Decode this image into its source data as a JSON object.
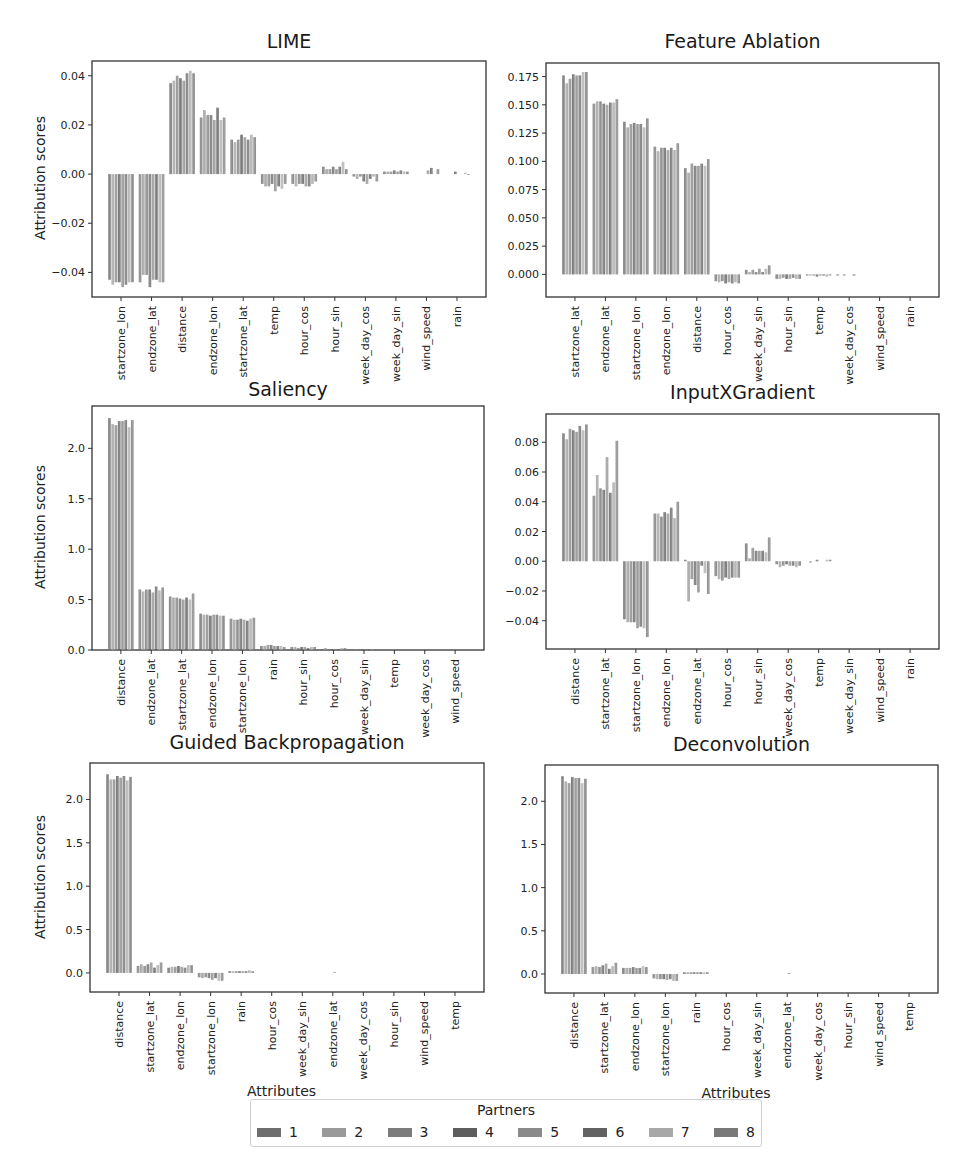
{
  "legend": {
    "title": "Partners",
    "items": [
      {
        "label": "1",
        "color": "#6e6e6e"
      },
      {
        "label": "2",
        "color": "#9a9a9a"
      },
      {
        "label": "3",
        "color": "#7c7c7c"
      },
      {
        "label": "4",
        "color": "#5e5e5e"
      },
      {
        "label": "5",
        "color": "#8a8a8a"
      },
      {
        "label": "6",
        "color": "#626262"
      },
      {
        "label": "7",
        "color": "#a8a8a8"
      },
      {
        "label": "8",
        "color": "#787878"
      }
    ]
  },
  "chart_data": [
    {
      "id": "lime",
      "type": "bar",
      "title": "LIME",
      "ylabel": "Attribution scores",
      "xlabel": "",
      "ylim": [
        -0.05,
        0.046
      ],
      "yticks": [
        -0.04,
        -0.02,
        0.0,
        0.02,
        0.04
      ],
      "ytick_labels": [
        "−0.04",
        "−0.02",
        "0.00",
        "0.02",
        "0.04"
      ],
      "categories": [
        "startzone_lon",
        "endzone_lat",
        "distance",
        "endzone_lon",
        "startzone_lat",
        "temp",
        "hour_cos",
        "hour_sin",
        "week_day_cos",
        "week_day_sin",
        "wind_speed",
        "rain"
      ],
      "series_names": [
        "1",
        "2",
        "3",
        "4",
        "5",
        "6",
        "7",
        "8"
      ],
      "values": [
        [
          -0.043,
          -0.045,
          -0.044,
          -0.044,
          -0.046,
          -0.045,
          -0.044,
          -0.044
        ],
        [
          -0.044,
          -0.041,
          -0.041,
          -0.046,
          -0.043,
          -0.043,
          -0.044,
          -0.044
        ],
        [
          0.037,
          0.038,
          0.04,
          0.039,
          0.038,
          0.041,
          0.042,
          0.041
        ],
        [
          0.023,
          0.026,
          0.024,
          0.024,
          0.022,
          0.027,
          0.022,
          0.023
        ],
        [
          0.014,
          0.013,
          0.014,
          0.016,
          0.015,
          0.014,
          0.016,
          0.015
        ],
        [
          -0.004,
          -0.005,
          -0.005,
          -0.004,
          -0.007,
          -0.005,
          -0.006,
          -0.004
        ],
        [
          -0.004,
          -0.005,
          -0.004,
          -0.004,
          -0.005,
          -0.005,
          -0.004,
          -0.003
        ],
        [
          0.003,
          0.002,
          0.002,
          0.003,
          0.002,
          0.003,
          0.005,
          0.002
        ],
        [
          -0.001,
          -0.002,
          -0.001,
          -0.003,
          -0.004,
          -0.002,
          -0.001,
          -0.003
        ],
        [
          0.001,
          0.001,
          0.001,
          0.0015,
          0.001,
          0.0015,
          0.001,
          0.001
        ],
        [
          0.0,
          0.0,
          0.0,
          0.0,
          0.0015,
          0.0025,
          0.0,
          0.002
        ],
        [
          0.0,
          0.0,
          0.0,
          0.001,
          0.0,
          0.0,
          0.0005,
          -0.0003
        ]
      ]
    },
    {
      "id": "feature_ablation",
      "type": "bar",
      "title": "Feature Ablation",
      "ylabel": "",
      "xlabel": "",
      "ylim": [
        -0.02,
        0.187
      ],
      "yticks": [
        0.0,
        0.025,
        0.05,
        0.075,
        0.1,
        0.125,
        0.15,
        0.175
      ],
      "ytick_labels": [
        "0.000",
        "0.025",
        "0.050",
        "0.075",
        "0.100",
        "0.125",
        "0.150",
        "0.175"
      ],
      "categories": [
        "startzone_lat",
        "endzone_lat",
        "startzone_lon",
        "endzone_lon",
        "distance",
        "hour_cos",
        "week_day_sin",
        "hour_sin",
        "temp",
        "week_day_cos",
        "wind_speed",
        "rain"
      ],
      "series_names": [
        "1",
        "2",
        "3",
        "4",
        "5",
        "6",
        "7",
        "8"
      ],
      "values": [
        [
          0.176,
          0.169,
          0.173,
          0.177,
          0.176,
          0.176,
          0.179,
          0.179
        ],
        [
          0.151,
          0.153,
          0.153,
          0.151,
          0.15,
          0.152,
          0.152,
          0.155
        ],
        [
          0.135,
          0.13,
          0.133,
          0.134,
          0.133,
          0.133,
          0.13,
          0.138
        ],
        [
          0.113,
          0.109,
          0.112,
          0.112,
          0.11,
          0.112,
          0.11,
          0.116
        ],
        [
          0.094,
          0.09,
          0.098,
          0.096,
          0.096,
          0.098,
          0.096,
          0.102
        ],
        [
          -0.006,
          -0.007,
          -0.006,
          -0.008,
          -0.007,
          -0.008,
          -0.007,
          -0.008
        ],
        [
          0.004,
          0.002,
          0.004,
          0.002,
          0.005,
          0.002,
          0.005,
          0.008
        ],
        [
          -0.004,
          -0.004,
          -0.003,
          -0.004,
          -0.004,
          -0.003,
          -0.004,
          -0.004
        ],
        [
          -0.001,
          -0.001,
          -0.001,
          -0.002,
          -0.001,
          -0.001,
          -0.002,
          -0.001
        ],
        [
          -0.001,
          0.0,
          -0.001,
          0.0,
          0.0,
          -0.001,
          0.0,
          0.0
        ],
        [
          0.0,
          0.0,
          0.0,
          0.0,
          0.0,
          0.0,
          0.0,
          0.0
        ],
        [
          0.0,
          0.0,
          0.0,
          0.0,
          0.0,
          0.0,
          0.0,
          0.0
        ]
      ]
    },
    {
      "id": "saliency",
      "type": "bar",
      "title": "Saliency",
      "ylabel": "Attribution scores",
      "xlabel": "",
      "ylim": [
        0.0,
        2.42
      ],
      "yticks": [
        0.0,
        0.5,
        1.0,
        1.5,
        2.0
      ],
      "ytick_labels": [
        "0.0",
        "0.5",
        "1.0",
        "1.5",
        "2.0"
      ],
      "categories": [
        "distance",
        "endzone_lat",
        "startzone_lat",
        "endzone_lon",
        "startzone_lon",
        "rain",
        "hour_sin",
        "hour_cos",
        "week_day_sin",
        "temp",
        "week_day_cos",
        "wind_speed"
      ],
      "series_names": [
        "1",
        "2",
        "3",
        "4",
        "5",
        "6",
        "7",
        "8"
      ],
      "values": [
        [
          2.3,
          2.24,
          2.23,
          2.27,
          2.27,
          2.28,
          2.21,
          2.28
        ],
        [
          0.6,
          0.58,
          0.6,
          0.6,
          0.57,
          0.63,
          0.59,
          0.62
        ],
        [
          0.53,
          0.52,
          0.52,
          0.51,
          0.5,
          0.52,
          0.5,
          0.56
        ],
        [
          0.36,
          0.35,
          0.35,
          0.34,
          0.35,
          0.35,
          0.34,
          0.34
        ],
        [
          0.31,
          0.3,
          0.3,
          0.31,
          0.3,
          0.29,
          0.31,
          0.32
        ],
        [
          0.04,
          0.04,
          0.05,
          0.05,
          0.04,
          0.04,
          0.04,
          0.03
        ],
        [
          0.03,
          0.03,
          0.02,
          0.03,
          0.03,
          0.02,
          0.03,
          0.03
        ],
        [
          0.01,
          0.02,
          0.01,
          0.01,
          0.01,
          0.01,
          0.02,
          0.02
        ],
        [
          0.005,
          0.005,
          0.005,
          0.005,
          0.005,
          0.005,
          0.005,
          0.005
        ],
        [
          0.0,
          0.0,
          0.0,
          0.0,
          0.0,
          0.0,
          0.0,
          0.0
        ],
        [
          0.0,
          0.0,
          0.0,
          0.0,
          0.0,
          0.0,
          0.0,
          0.0
        ],
        [
          0.0,
          0.0,
          0.0,
          0.0,
          0.0,
          0.0,
          0.0,
          0.0
        ]
      ]
    },
    {
      "id": "input_x_gradient",
      "type": "bar",
      "title": "InputXGradient",
      "ylabel": "",
      "xlabel": "",
      "ylim": [
        -0.059,
        0.099
      ],
      "yticks": [
        -0.04,
        -0.02,
        0.0,
        0.02,
        0.04,
        0.06,
        0.08
      ],
      "ytick_labels": [
        "−0.04",
        "−0.02",
        "0.00",
        "0.02",
        "0.04",
        "0.06",
        "0.08"
      ],
      "categories": [
        "distance",
        "startzone_lat",
        "startzone_lon",
        "endzone_lon",
        "endzone_lat",
        "hour_cos",
        "hour_sin",
        "week_day_cos",
        "temp",
        "week_day_sin",
        "wind_speed",
        "rain"
      ],
      "series_names": [
        "1",
        "2",
        "3",
        "4",
        "5",
        "6",
        "7",
        "8"
      ],
      "values": [
        [
          0.086,
          0.082,
          0.089,
          0.088,
          0.087,
          0.091,
          0.088,
          0.092
        ],
        [
          0.044,
          0.058,
          0.049,
          0.048,
          0.07,
          0.046,
          0.053,
          0.081
        ],
        [
          -0.039,
          -0.041,
          -0.041,
          -0.041,
          -0.045,
          -0.044,
          -0.045,
          -0.051
        ],
        [
          0.032,
          0.032,
          0.03,
          0.033,
          0.032,
          0.036,
          0.029,
          0.04
        ],
        [
          0.001,
          -0.027,
          -0.012,
          -0.016,
          -0.021,
          -0.003,
          -0.008,
          -0.022
        ],
        [
          -0.01,
          -0.012,
          -0.013,
          -0.011,
          -0.012,
          -0.011,
          -0.011,
          -0.011
        ],
        [
          0.012,
          0.002,
          0.009,
          0.007,
          0.007,
          0.007,
          0.006,
          0.016
        ],
        [
          -0.002,
          -0.004,
          -0.003,
          -0.002,
          -0.003,
          -0.003,
          -0.004,
          -0.003
        ],
        [
          0.0,
          -0.001,
          0.0,
          0.001,
          0.0,
          0.0,
          0.001,
          0.001
        ],
        [
          0.0,
          0.0,
          0.0,
          0.0,
          0.0,
          0.0,
          0.0,
          0.0
        ],
        [
          0.0,
          0.0,
          0.0,
          0.0,
          0.0,
          0.0,
          0.0,
          0.0
        ],
        [
          0.0,
          0.0,
          0.0,
          0.0,
          0.0,
          0.0,
          0.0,
          0.0
        ]
      ]
    },
    {
      "id": "guided_backprop",
      "type": "bar",
      "title": "Guided Backpropagation",
      "ylabel": "Attribution scores",
      "xlabel": "Attributes",
      "ylim": [
        -0.22,
        2.42
      ],
      "yticks": [
        0.0,
        0.5,
        1.0,
        1.5,
        2.0
      ],
      "ytick_labels": [
        "0.0",
        "0.5",
        "1.0",
        "1.5",
        "2.0"
      ],
      "categories": [
        "distance",
        "startzone_lat",
        "endzone_lon",
        "startzone_lon",
        "rain",
        "hour_cos",
        "week_day_sin",
        "endzone_lat",
        "week_day_cos",
        "hour_sin",
        "wind_speed",
        "temp"
      ],
      "series_names": [
        "1",
        "2",
        "3",
        "4",
        "5",
        "6",
        "7",
        "8"
      ],
      "values": [
        [
          2.29,
          2.23,
          2.23,
          2.27,
          2.25,
          2.27,
          2.22,
          2.26
        ],
        [
          0.08,
          0.1,
          0.08,
          0.1,
          0.12,
          0.06,
          0.09,
          0.12
        ],
        [
          0.06,
          0.07,
          0.07,
          0.08,
          0.07,
          0.06,
          0.09,
          0.09
        ],
        [
          -0.05,
          -0.06,
          -0.05,
          -0.06,
          -0.08,
          -0.06,
          -0.09,
          -0.09
        ],
        [
          0.02,
          0.02,
          0.02,
          0.02,
          0.02,
          0.02,
          0.03,
          0.02
        ],
        [
          0.0,
          0.0,
          0.0,
          0.0,
          0.0,
          0.0,
          0.0,
          0.0
        ],
        [
          0.0,
          0.0,
          0.0,
          0.0,
          0.0,
          0.0,
          0.0,
          0.0
        ],
        [
          0.0,
          0.0,
          0.0,
          0.0,
          0.01,
          0.0,
          0.0,
          0.0
        ],
        [
          0.0,
          0.0,
          0.0,
          0.0,
          0.0,
          0.0,
          0.0,
          0.0
        ],
        [
          0.0,
          0.0,
          0.0,
          0.0,
          0.0,
          0.0,
          0.0,
          0.0
        ],
        [
          0.0,
          0.0,
          0.0,
          0.0,
          0.0,
          0.0,
          0.0,
          0.0
        ],
        [
          0.0,
          0.0,
          0.0,
          0.0,
          0.0,
          0.0,
          0.0,
          0.0
        ]
      ]
    },
    {
      "id": "deconvolution",
      "type": "bar",
      "title": "Deconvolution",
      "ylabel": "",
      "xlabel": "Attributes",
      "ylim": [
        -0.22,
        2.42
      ],
      "yticks": [
        0.0,
        0.5,
        1.0,
        1.5,
        2.0
      ],
      "ytick_labels": [
        "0.0",
        "0.5",
        "1.0",
        "1.5",
        "2.0"
      ],
      "categories": [
        "distance",
        "startzone_lat",
        "endzone_lon",
        "startzone_lon",
        "rain",
        "hour_cos",
        "week_day_sin",
        "endzone_lat",
        "week_day_cos",
        "hour_sin",
        "wind_speed",
        "temp"
      ],
      "series_names": [
        "1",
        "2",
        "3",
        "4",
        "5",
        "6",
        "7",
        "8"
      ],
      "values": [
        [
          2.29,
          2.23,
          2.21,
          2.28,
          2.27,
          2.27,
          2.21,
          2.26
        ],
        [
          0.08,
          0.09,
          0.08,
          0.1,
          0.12,
          0.06,
          0.09,
          0.13
        ],
        [
          0.07,
          0.07,
          0.07,
          0.08,
          0.07,
          0.07,
          0.09,
          0.08
        ],
        [
          -0.05,
          -0.06,
          -0.06,
          -0.06,
          -0.07,
          -0.06,
          -0.08,
          -0.08
        ],
        [
          0.02,
          0.02,
          0.02,
          0.02,
          0.02,
          0.02,
          0.02,
          0.02
        ],
        [
          0.0,
          0.0,
          0.0,
          0.0,
          0.0,
          0.0,
          0.0,
          0.0
        ],
        [
          0.0,
          0.0,
          0.0,
          0.0,
          0.0,
          0.0,
          0.0,
          0.0
        ],
        [
          0.0,
          0.0,
          0.0,
          0.0,
          0.01,
          0.0,
          0.0,
          0.0
        ],
        [
          0.0,
          0.0,
          0.0,
          0.0,
          0.0,
          0.0,
          0.0,
          0.0
        ],
        [
          0.0,
          0.0,
          0.0,
          0.0,
          0.0,
          0.0,
          0.0,
          0.0
        ],
        [
          0.0,
          0.0,
          0.0,
          0.0,
          0.0,
          0.0,
          0.0,
          0.0
        ],
        [
          0.0,
          0.0,
          0.0,
          0.0,
          0.0,
          0.0,
          0.0,
          0.0
        ]
      ]
    }
  ]
}
